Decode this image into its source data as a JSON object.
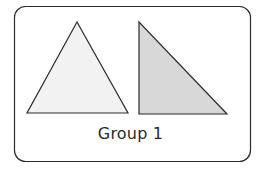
{
  "diagram": {
    "frame": {
      "x": 14,
      "y": 6,
      "width": 236,
      "height": 155,
      "radius": 11,
      "stroke": "#2b2b2b",
      "fill": "#ffffff"
    },
    "shapes": [
      {
        "name": "triangle-isosceles",
        "points": "77,22 27,113 128,113",
        "fill": "#f2f2f2",
        "stroke": "#2b2b2b"
      },
      {
        "name": "triangle-right",
        "points": "139,22 139,114 227,114",
        "fill": "#d8d8d8",
        "stroke": "#2b2b2b"
      }
    ],
    "caption": "Group 1"
  }
}
